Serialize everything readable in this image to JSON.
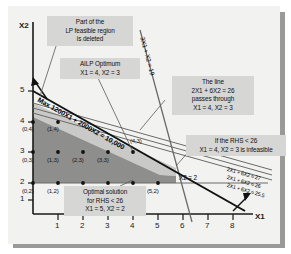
{
  "figure": {
    "axes": {
      "x_label": "X1",
      "y_label": "X2",
      "x_ticks": [
        "1",
        "2",
        "3",
        "4",
        "5",
        "6",
        "7",
        "8"
      ],
      "y_ticks": [
        "1",
        "2",
        "3",
        "4",
        "5"
      ]
    },
    "callouts": [
      {
        "id": "deleted-region",
        "text": "Part of the\nLP feasible region\nis deleted"
      },
      {
        "id": "ailp-optimum",
        "text": "AILP Optimum\nX1 = 4, X2 = 3"
      },
      {
        "id": "line-26",
        "text": "The line\n2X1 + 6X2 = 26\npasses through\nX1 = 4, X2 = 3"
      },
      {
        "id": "rhs-infeasible",
        "text": "If the RHS < 26\nX1 = 4, X2 = 3 is infeasible"
      },
      {
        "id": "optimal-solution",
        "text": "Optimal solution\nfor RHS < 26\nX1 = 5, X2 = 2"
      }
    ],
    "line_labels": [
      {
        "id": "objective",
        "text": "Max 1200X1 + 2000X2 = 10,000"
      },
      {
        "id": "constraint-3x1x2",
        "text": "3X1 + X2 = 19"
      },
      {
        "id": "constraint-x2",
        "text": "X2 = 2"
      },
      {
        "id": "rhs-27",
        "text": "2X1 + 6X2 = 27"
      },
      {
        "id": "rhs-26",
        "text": "2X1 + 6X2 = 26"
      },
      {
        "id": "rhs-255",
        "text": "2X1 + 6X2 = 25.5"
      }
    ],
    "lattice_points": [
      "(0,4)",
      "(1,4)",
      "(0,3)",
      "(1,3)",
      "(2,3)",
      "(3,3)",
      "(4,3)",
      "(0,2)",
      "(1,2)",
      "(2,2)",
      "(3,2)",
      "(4,2)",
      "(5,2)"
    ],
    "colors": {
      "plate": "#f2f2f0",
      "feasible_fill": "#8e8e8c",
      "deleted_fill": "#c9c9c7",
      "callout_bg": "#d6d6d4",
      "line": "#4a4a4a",
      "axis": "#1a1a1a"
    }
  }
}
